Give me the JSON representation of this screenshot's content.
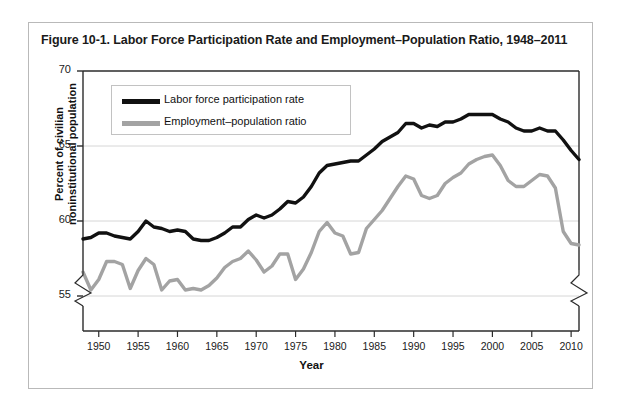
{
  "figure": {
    "title": "Figure 10-1. Labor Force Participation Rate and Employment–Population Ratio, 1948–2011"
  },
  "legend": {
    "position": "top-left-inside",
    "items": [
      {
        "label": "Labor force participation rate",
        "color": "#111111"
      },
      {
        "label": "Employment–population ratio",
        "color": "#a3a3a3"
      }
    ]
  },
  "axes": {
    "y_title_line1": "Percent of civilian",
    "y_title_line2": "noninstitutional population",
    "x_title": "Year",
    "y_ticks": [
      "55",
      "60",
      "65",
      "70"
    ],
    "x_ticks": [
      "1950",
      "1955",
      "1960",
      "1965",
      "1970",
      "1975",
      "1980",
      "1985",
      "1990",
      "1995",
      "2000",
      "2005",
      "2010"
    ],
    "axis_break": "both"
  },
  "chart_data": {
    "type": "line",
    "title": "Figure 10-1. Labor Force Participation Rate and Employment–Population Ratio, 1948–2011",
    "xlabel": "Year",
    "ylabel": "Percent of civilian noninstitutional population",
    "xlim": [
      1948,
      2011
    ],
    "ylim": [
      53.5,
      70
    ],
    "ytick_values": [
      55,
      60,
      65,
      70
    ],
    "xtick_values": [
      1950,
      1955,
      1960,
      1965,
      1970,
      1975,
      1980,
      1985,
      1990,
      1995,
      2000,
      2005,
      2010
    ],
    "grid": "horizontal",
    "y_axis_broken_below": 55,
    "x": [
      1948,
      1949,
      1950,
      1951,
      1952,
      1953,
      1954,
      1955,
      1956,
      1957,
      1958,
      1959,
      1960,
      1961,
      1962,
      1963,
      1964,
      1965,
      1966,
      1967,
      1968,
      1969,
      1970,
      1971,
      1972,
      1973,
      1974,
      1975,
      1976,
      1977,
      1978,
      1979,
      1980,
      1981,
      1982,
      1983,
      1984,
      1985,
      1986,
      1987,
      1988,
      1989,
      1990,
      1991,
      1992,
      1993,
      1994,
      1995,
      1996,
      1997,
      1998,
      1999,
      2000,
      2001,
      2002,
      2003,
      2004,
      2005,
      2006,
      2007,
      2008,
      2009,
      2010,
      2011
    ],
    "series": [
      {
        "name": "Labor force participation rate",
        "color": "#111111",
        "linewidth": 3.4,
        "values": [
          58.8,
          58.9,
          59.2,
          59.2,
          59.0,
          58.9,
          58.8,
          59.3,
          60.0,
          59.6,
          59.5,
          59.3,
          59.4,
          59.3,
          58.8,
          58.7,
          58.7,
          58.9,
          59.2,
          59.6,
          59.6,
          60.1,
          60.4,
          60.2,
          60.4,
          60.8,
          61.3,
          61.2,
          61.6,
          62.3,
          63.2,
          63.7,
          63.8,
          63.9,
          64.0,
          64.0,
          64.4,
          64.8,
          65.3,
          65.6,
          65.9,
          66.5,
          66.5,
          66.2,
          66.4,
          66.3,
          66.6,
          66.6,
          66.8,
          67.1,
          67.1,
          67.1,
          67.1,
          66.8,
          66.6,
          66.2,
          66.0,
          66.0,
          66.2,
          66.0,
          66.0,
          65.4,
          64.7,
          64.1
        ]
      },
      {
        "name": "Employment–population ratio",
        "color": "#a3a3a3",
        "linewidth": 3.4,
        "values": [
          56.6,
          55.4,
          56.1,
          57.3,
          57.3,
          57.1,
          55.5,
          56.7,
          57.5,
          57.1,
          55.4,
          56.0,
          56.1,
          55.4,
          55.5,
          55.4,
          55.7,
          56.2,
          56.9,
          57.3,
          57.5,
          58.0,
          57.4,
          56.6,
          57.0,
          57.8,
          57.8,
          56.1,
          56.8,
          57.9,
          59.3,
          59.9,
          59.2,
          59.0,
          57.8,
          57.9,
          59.5,
          60.1,
          60.7,
          61.5,
          62.3,
          63.0,
          62.8,
          61.7,
          61.5,
          61.7,
          62.5,
          62.9,
          63.2,
          63.8,
          64.1,
          64.3,
          64.4,
          63.7,
          62.7,
          62.3,
          62.3,
          62.7,
          63.1,
          63.0,
          62.2,
          59.3,
          58.5,
          58.4
        ]
      }
    ]
  }
}
